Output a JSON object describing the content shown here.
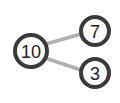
{
  "diagram": {
    "type": "number-bond",
    "whole": {
      "label": "10"
    },
    "parts": [
      {
        "label": "7"
      },
      {
        "label": "3"
      }
    ],
    "colors": {
      "circle_stroke": "#3a3a3a",
      "connector": "#b0b0b0",
      "text": "#222222",
      "background": "#ffffff"
    }
  }
}
